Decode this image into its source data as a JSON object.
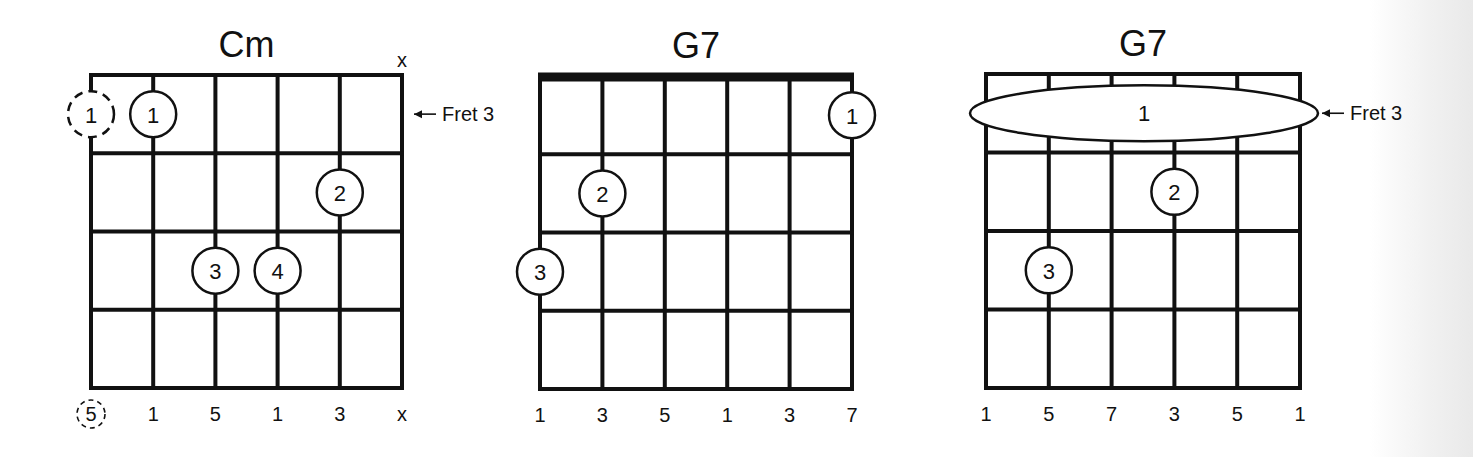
{
  "diagrams": [
    {
      "name": "Cm",
      "nut": false,
      "fret_label": "Fret 3",
      "fret_label_row": 1,
      "top_markers": [
        null,
        null,
        null,
        null,
        null,
        "x"
      ],
      "fingers": [
        {
          "string": 1,
          "fret": 1,
          "finger": "1",
          "optional": true
        },
        {
          "string": 2,
          "fret": 1,
          "finger": "1"
        },
        {
          "string": 5,
          "fret": 2,
          "finger": "2"
        },
        {
          "string": 3,
          "fret": 3,
          "finger": "3"
        },
        {
          "string": 4,
          "fret": 3,
          "finger": "4"
        }
      ],
      "barre": null,
      "bottom_labels": [
        {
          "text": "5",
          "optional": true
        },
        {
          "text": "1"
        },
        {
          "text": "5"
        },
        {
          "text": "1"
        },
        {
          "text": "3"
        },
        {
          "text": "x"
        }
      ]
    },
    {
      "name": "G7",
      "nut": true,
      "fret_label": "",
      "fret_label_row": null,
      "top_markers": [
        null,
        null,
        null,
        null,
        null,
        null
      ],
      "fingers": [
        {
          "string": 6,
          "fret": 1,
          "finger": "1"
        },
        {
          "string": 2,
          "fret": 2,
          "finger": "2"
        },
        {
          "string": 1,
          "fret": 3,
          "finger": "3"
        }
      ],
      "barre": null,
      "bottom_labels": [
        {
          "text": "1"
        },
        {
          "text": "3"
        },
        {
          "text": "5"
        },
        {
          "text": "1"
        },
        {
          "text": "3"
        },
        {
          "text": "7"
        }
      ]
    },
    {
      "name": "G7",
      "nut": false,
      "fret_label": "Fret 3",
      "fret_label_row": 1,
      "top_markers": [
        null,
        null,
        null,
        null,
        null,
        null
      ],
      "fingers": [
        {
          "string": 4,
          "fret": 2,
          "finger": "2"
        },
        {
          "string": 2,
          "fret": 3,
          "finger": "3"
        }
      ],
      "barre": {
        "fret": 1,
        "from_string": 1,
        "to_string": 6,
        "finger": "1"
      },
      "bottom_labels": [
        {
          "text": "1"
        },
        {
          "text": "5"
        },
        {
          "text": "7"
        },
        {
          "text": "3"
        },
        {
          "text": "5"
        },
        {
          "text": "1"
        }
      ]
    }
  ]
}
